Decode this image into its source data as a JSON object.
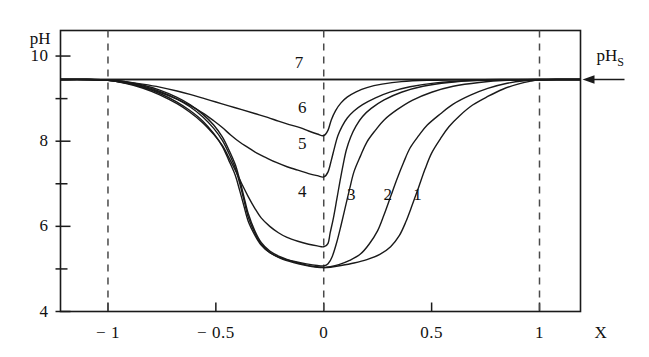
{
  "chart_data": {
    "type": "line",
    "title": "",
    "xlabel": "X",
    "ylabel": "pH",
    "xlim": [
      -1.22,
      1.19
    ],
    "ylim": [
      4,
      10.6
    ],
    "grid": false,
    "legend_position": "inline-curve-labels",
    "x_ticks": [
      {
        "value": -1,
        "label": "− 1"
      },
      {
        "value": -0.5,
        "label": "− 0.5"
      },
      {
        "value": 0,
        "label": "0"
      },
      {
        "value": 0.5,
        "label": "0.5"
      },
      {
        "value": 1,
        "label": "1"
      }
    ],
    "y_ticks": [
      {
        "value": 4,
        "label": "4"
      },
      {
        "value": 5,
        "label": ""
      },
      {
        "value": 6,
        "label": "6"
      },
      {
        "value": 7,
        "label": ""
      },
      {
        "value": 8,
        "label": "8"
      },
      {
        "value": 9,
        "label": ""
      },
      {
        "value": 10,
        "label": "10"
      }
    ],
    "reference_lines": {
      "horizontal": [
        {
          "value": 9.45,
          "label": "pH",
          "label_sub": "S",
          "style": "solid",
          "arrow": "left"
        }
      ],
      "vertical": [
        {
          "value": -1,
          "style": "dashed"
        },
        {
          "value": 0,
          "style": "dashed"
        },
        {
          "value": 1,
          "style": "dashed"
        }
      ]
    },
    "annotations": [
      {
        "text": "7",
        "x": -0.115,
        "y": 9.83
      },
      {
        "text": "6",
        "x": -0.1,
        "y": 8.78
      },
      {
        "text": "5",
        "x": -0.1,
        "y": 7.93
      },
      {
        "text": "4",
        "x": -0.1,
        "y": 6.8
      },
      {
        "text": "3",
        "x": 0.128,
        "y": 6.73
      },
      {
        "text": "2",
        "x": 0.297,
        "y": 6.73
      },
      {
        "text": "1",
        "x": 0.434,
        "y": 6.73
      }
    ],
    "series": [
      {
        "name": "1",
        "min_value": 5.05,
        "min_x": 0.0,
        "points": [
          [
            -1.22,
            9.45
          ],
          [
            -1.1,
            9.45
          ],
          [
            -1.0,
            9.44
          ],
          [
            -0.92,
            9.4
          ],
          [
            -0.84,
            9.32
          ],
          [
            -0.76,
            9.2
          ],
          [
            -0.68,
            9.03
          ],
          [
            -0.62,
            8.86
          ],
          [
            -0.56,
            8.63
          ],
          [
            -0.51,
            8.38
          ],
          [
            -0.47,
            8.1
          ],
          [
            -0.44,
            7.8
          ],
          [
            -0.41,
            7.45
          ],
          [
            -0.39,
            7.1
          ],
          [
            -0.37,
            6.7
          ],
          [
            -0.35,
            6.3
          ],
          [
            -0.32,
            5.9
          ],
          [
            -0.29,
            5.62
          ],
          [
            -0.25,
            5.42
          ],
          [
            -0.2,
            5.28
          ],
          [
            -0.14,
            5.17
          ],
          [
            -0.08,
            5.09
          ],
          [
            -0.03,
            5.05
          ],
          [
            0.0,
            5.03
          ],
          [
            0.03,
            5.04
          ],
          [
            0.08,
            5.08
          ],
          [
            0.14,
            5.14
          ],
          [
            0.2,
            5.22
          ],
          [
            0.26,
            5.34
          ],
          [
            0.31,
            5.52
          ],
          [
            0.35,
            5.78
          ],
          [
            0.38,
            6.1
          ],
          [
            0.41,
            6.5
          ],
          [
            0.44,
            6.92
          ],
          [
            0.47,
            7.35
          ],
          [
            0.5,
            7.72
          ],
          [
            0.54,
            8.05
          ],
          [
            0.58,
            8.34
          ],
          [
            0.63,
            8.6
          ],
          [
            0.69,
            8.85
          ],
          [
            0.76,
            9.05
          ],
          [
            0.83,
            9.22
          ],
          [
            0.9,
            9.34
          ],
          [
            0.96,
            9.41
          ],
          [
            1.0,
            9.44
          ],
          [
            1.08,
            9.45
          ],
          [
            1.19,
            9.45
          ]
        ]
      },
      {
        "name": "2",
        "min_value": 5.05,
        "min_x": 0.0,
        "points": [
          [
            -1.22,
            9.45
          ],
          [
            -1.1,
            9.45
          ],
          [
            -1.0,
            9.44
          ],
          [
            -0.92,
            9.39
          ],
          [
            -0.84,
            9.3
          ],
          [
            -0.76,
            9.17
          ],
          [
            -0.68,
            8.99
          ],
          [
            -0.62,
            8.81
          ],
          [
            -0.56,
            8.57
          ],
          [
            -0.51,
            8.3
          ],
          [
            -0.47,
            8.02
          ],
          [
            -0.44,
            7.72
          ],
          [
            -0.41,
            7.37
          ],
          [
            -0.39,
            7.02
          ],
          [
            -0.37,
            6.62
          ],
          [
            -0.35,
            6.22
          ],
          [
            -0.32,
            5.85
          ],
          [
            -0.29,
            5.58
          ],
          [
            -0.25,
            5.39
          ],
          [
            -0.2,
            5.25
          ],
          [
            -0.14,
            5.15
          ],
          [
            -0.08,
            5.08
          ],
          [
            -0.03,
            5.04
          ],
          [
            0.0,
            5.03
          ],
          [
            0.03,
            5.05
          ],
          [
            0.07,
            5.1
          ],
          [
            0.12,
            5.2
          ],
          [
            0.17,
            5.35
          ],
          [
            0.21,
            5.58
          ],
          [
            0.25,
            5.9
          ],
          [
            0.28,
            6.28
          ],
          [
            0.31,
            6.7
          ],
          [
            0.34,
            7.12
          ],
          [
            0.37,
            7.5
          ],
          [
            0.4,
            7.84
          ],
          [
            0.44,
            8.13
          ],
          [
            0.48,
            8.38
          ],
          [
            0.54,
            8.64
          ],
          [
            0.6,
            8.87
          ],
          [
            0.68,
            9.08
          ],
          [
            0.76,
            9.24
          ],
          [
            0.85,
            9.36
          ],
          [
            0.93,
            9.42
          ],
          [
            1.0,
            9.44
          ],
          [
            1.08,
            9.45
          ],
          [
            1.19,
            9.45
          ]
        ]
      },
      {
        "name": "3",
        "min_value": 5.1,
        "min_x": 0.0,
        "points": [
          [
            -1.22,
            9.45
          ],
          [
            -1.1,
            9.45
          ],
          [
            -1.0,
            9.43
          ],
          [
            -0.92,
            9.37
          ],
          [
            -0.84,
            9.27
          ],
          [
            -0.76,
            9.12
          ],
          [
            -0.68,
            8.92
          ],
          [
            -0.62,
            8.72
          ],
          [
            -0.56,
            8.47
          ],
          [
            -0.51,
            8.18
          ],
          [
            -0.47,
            7.88
          ],
          [
            -0.44,
            7.55
          ],
          [
            -0.41,
            7.2
          ],
          [
            -0.39,
            6.85
          ],
          [
            -0.37,
            6.48
          ],
          [
            -0.35,
            6.12
          ],
          [
            -0.32,
            5.8
          ],
          [
            -0.29,
            5.56
          ],
          [
            -0.25,
            5.38
          ],
          [
            -0.2,
            5.26
          ],
          [
            -0.14,
            5.18
          ],
          [
            -0.08,
            5.12
          ],
          [
            -0.03,
            5.08
          ],
          [
            0.0,
            5.07
          ],
          [
            0.02,
            5.12
          ],
          [
            0.04,
            5.3
          ],
          [
            0.06,
            5.62
          ],
          [
            0.08,
            6.02
          ],
          [
            0.1,
            6.45
          ],
          [
            0.12,
            6.88
          ],
          [
            0.14,
            7.28
          ],
          [
            0.17,
            7.65
          ],
          [
            0.2,
            7.98
          ],
          [
            0.24,
            8.26
          ],
          [
            0.28,
            8.5
          ],
          [
            0.34,
            8.74
          ],
          [
            0.41,
            8.96
          ],
          [
            0.5,
            9.15
          ],
          [
            0.6,
            9.29
          ],
          [
            0.72,
            9.38
          ],
          [
            0.85,
            9.43
          ],
          [
            1.0,
            9.44
          ],
          [
            1.08,
            9.45
          ],
          [
            1.19,
            9.45
          ]
        ]
      },
      {
        "name": "4",
        "min_value": 5.55,
        "min_x": 0.0,
        "points": [
          [
            -1.22,
            9.45
          ],
          [
            -1.1,
            9.45
          ],
          [
            -1.0,
            9.43
          ],
          [
            -0.92,
            9.36
          ],
          [
            -0.84,
            9.25
          ],
          [
            -0.76,
            9.09
          ],
          [
            -0.68,
            8.88
          ],
          [
            -0.62,
            8.68
          ],
          [
            -0.56,
            8.43
          ],
          [
            -0.51,
            8.16
          ],
          [
            -0.47,
            7.9
          ],
          [
            -0.44,
            7.62
          ],
          [
            -0.41,
            7.32
          ],
          [
            -0.38,
            7.0
          ],
          [
            -0.35,
            6.7
          ],
          [
            -0.32,
            6.43
          ],
          [
            -0.29,
            6.2
          ],
          [
            -0.25,
            6.0
          ],
          [
            -0.21,
            5.85
          ],
          [
            -0.17,
            5.74
          ],
          [
            -0.12,
            5.65
          ],
          [
            -0.07,
            5.58
          ],
          [
            -0.03,
            5.54
          ],
          [
            0.0,
            5.52
          ],
          [
            0.02,
            5.6
          ],
          [
            0.03,
            5.85
          ],
          [
            0.045,
            6.2
          ],
          [
            0.06,
            6.62
          ],
          [
            0.075,
            7.05
          ],
          [
            0.09,
            7.45
          ],
          [
            0.105,
            7.8
          ],
          [
            0.125,
            8.1
          ],
          [
            0.15,
            8.36
          ],
          [
            0.18,
            8.58
          ],
          [
            0.22,
            8.77
          ],
          [
            0.28,
            8.97
          ],
          [
            0.36,
            9.15
          ],
          [
            0.46,
            9.29
          ],
          [
            0.58,
            9.38
          ],
          [
            0.72,
            9.43
          ],
          [
            0.88,
            9.44
          ],
          [
            1.0,
            9.45
          ],
          [
            1.08,
            9.45
          ],
          [
            1.19,
            9.45
          ]
        ]
      },
      {
        "name": "5",
        "min_value": 7.2,
        "min_x": 0.0,
        "points": [
          [
            -1.22,
            9.45
          ],
          [
            -1.1,
            9.45
          ],
          [
            -1.0,
            9.43
          ],
          [
            -0.92,
            9.37
          ],
          [
            -0.84,
            9.28
          ],
          [
            -0.76,
            9.15
          ],
          [
            -0.68,
            8.99
          ],
          [
            -0.62,
            8.84
          ],
          [
            -0.56,
            8.66
          ],
          [
            -0.51,
            8.48
          ],
          [
            -0.47,
            8.32
          ],
          [
            -0.43,
            8.14
          ],
          [
            -0.39,
            7.98
          ],
          [
            -0.35,
            7.85
          ],
          [
            -0.31,
            7.72
          ],
          [
            -0.27,
            7.62
          ],
          [
            -0.22,
            7.5
          ],
          [
            -0.17,
            7.4
          ],
          [
            -0.12,
            7.32
          ],
          [
            -0.07,
            7.24
          ],
          [
            -0.03,
            7.19
          ],
          [
            0.0,
            7.16
          ],
          [
            0.02,
            7.28
          ],
          [
            0.035,
            7.55
          ],
          [
            0.05,
            7.85
          ],
          [
            0.065,
            8.12
          ],
          [
            0.085,
            8.35
          ],
          [
            0.11,
            8.55
          ],
          [
            0.14,
            8.71
          ],
          [
            0.18,
            8.86
          ],
          [
            0.24,
            9.02
          ],
          [
            0.31,
            9.16
          ],
          [
            0.4,
            9.28
          ],
          [
            0.52,
            9.37
          ],
          [
            0.66,
            9.42
          ],
          [
            0.82,
            9.44
          ],
          [
            1.0,
            9.45
          ],
          [
            1.08,
            9.45
          ],
          [
            1.19,
            9.45
          ]
        ]
      },
      {
        "name": "6",
        "min_value": 8.15,
        "min_x": 0.0,
        "points": [
          [
            -1.22,
            9.45
          ],
          [
            -1.1,
            9.45
          ],
          [
            -1.0,
            9.44
          ],
          [
            -0.92,
            9.4
          ],
          [
            -0.84,
            9.34
          ],
          [
            -0.76,
            9.27
          ],
          [
            -0.68,
            9.18
          ],
          [
            -0.62,
            9.1
          ],
          [
            -0.56,
            9.01
          ],
          [
            -0.5,
            8.92
          ],
          [
            -0.44,
            8.83
          ],
          [
            -0.38,
            8.74
          ],
          [
            -0.32,
            8.65
          ],
          [
            -0.26,
            8.56
          ],
          [
            -0.21,
            8.47
          ],
          [
            -0.16,
            8.39
          ],
          [
            -0.11,
            8.32
          ],
          [
            -0.07,
            8.24
          ],
          [
            -0.03,
            8.17
          ],
          [
            0.0,
            8.13
          ],
          [
            0.02,
            8.26
          ],
          [
            0.035,
            8.5
          ],
          [
            0.055,
            8.72
          ],
          [
            0.08,
            8.9
          ],
          [
            0.11,
            9.04
          ],
          [
            0.15,
            9.16
          ],
          [
            0.2,
            9.26
          ],
          [
            0.27,
            9.34
          ],
          [
            0.36,
            9.4
          ],
          [
            0.48,
            9.43
          ],
          [
            0.63,
            9.44
          ],
          [
            0.82,
            9.45
          ],
          [
            1.0,
            9.45
          ],
          [
            1.19,
            9.45
          ]
        ]
      },
      {
        "name": "7",
        "min_value": 9.45,
        "min_x": 0.0,
        "points": [
          [
            -1.22,
            9.45
          ],
          [
            -0.8,
            9.45
          ],
          [
            -0.4,
            9.45
          ],
          [
            0.0,
            9.45
          ],
          [
            0.4,
            9.45
          ],
          [
            0.8,
            9.45
          ],
          [
            1.19,
            9.45
          ]
        ]
      }
    ]
  },
  "axes": {
    "y_axis_title": "pH",
    "x_axis_title": "X",
    "reference_label": "pH",
    "reference_label_sub": "S"
  },
  "colors": {
    "line": "#1a1a1a",
    "frame": "#1a1a1a",
    "dashed": "#4a4a4a",
    "background": "#ffffff",
    "text": "#111111"
  }
}
